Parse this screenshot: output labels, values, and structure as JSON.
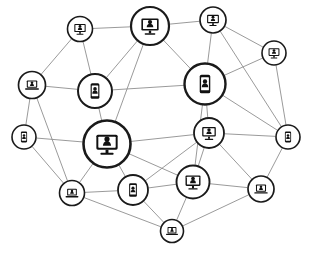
{
  "diagram": {
    "type": "node-link-network",
    "background_color": "#ffffff",
    "node_fill_color": "#ffffff",
    "node_stroke_color": "#1a1a1a",
    "icon_color": "#111111",
    "edge_color": "#8e8e8e",
    "node_count": 18,
    "edge_count": 38,
    "nodes": [
      {
        "id": "n1",
        "name": "monitor-node-top-left",
        "device": "monitor",
        "x": 80,
        "y": 29,
        "r": 12.5,
        "ring": 1.6
      },
      {
        "id": "n2",
        "name": "monitor-node-top-center",
        "device": "monitor",
        "x": 150,
        "y": 26,
        "r": 19.0,
        "ring": 2.2
      },
      {
        "id": "n3",
        "name": "monitor-node-top-right",
        "device": "monitor",
        "x": 213,
        "y": 20,
        "r": 13.0,
        "ring": 1.7
      },
      {
        "id": "n4",
        "name": "monitor-node-upper-right-edge",
        "device": "monitor",
        "x": 274,
        "y": 53,
        "r": 12.0,
        "ring": 1.6
      },
      {
        "id": "n5",
        "name": "laptop-node-upper-left-edge",
        "device": "laptop",
        "x": 32,
        "y": 85,
        "r": 13.5,
        "ring": 1.7
      },
      {
        "id": "n6",
        "name": "phone-node-upper-left-center",
        "device": "phone",
        "x": 95,
        "y": 91,
        "r": 17.0,
        "ring": 2.0
      },
      {
        "id": "n7",
        "name": "phone-node-upper-center-right",
        "device": "phone",
        "x": 205,
        "y": 84,
        "r": 20.5,
        "ring": 2.4
      },
      {
        "id": "n8",
        "name": "phone-node-left-edge",
        "device": "phone",
        "x": 24,
        "y": 137,
        "r": 12.0,
        "ring": 1.6
      },
      {
        "id": "n9",
        "name": "monitor-node-center-hub",
        "device": "monitor",
        "x": 107,
        "y": 144,
        "r": 23.5,
        "ring": 2.6
      },
      {
        "id": "n10",
        "name": "monitor-node-center-right",
        "device": "monitor",
        "x": 209,
        "y": 133,
        "r": 15.0,
        "ring": 1.8
      },
      {
        "id": "n11",
        "name": "phone-node-right-edge",
        "device": "phone",
        "x": 288,
        "y": 137,
        "r": 12.0,
        "ring": 1.6
      },
      {
        "id": "n12",
        "name": "laptop-node-lower-left",
        "device": "laptop",
        "x": 72,
        "y": 193,
        "r": 12.5,
        "ring": 1.6
      },
      {
        "id": "n13",
        "name": "phone-node-lower-center-left",
        "device": "phone",
        "x": 133,
        "y": 190,
        "r": 15.0,
        "ring": 1.8
      },
      {
        "id": "n14",
        "name": "monitor-node-lower-center",
        "device": "monitor",
        "x": 193,
        "y": 182,
        "r": 16.5,
        "ring": 1.9
      },
      {
        "id": "n15",
        "name": "laptop-node-lower-right",
        "device": "laptop",
        "x": 261,
        "y": 189,
        "r": 13.0,
        "ring": 1.7
      },
      {
        "id": "n16",
        "name": "laptop-node-bottom",
        "device": "laptop",
        "x": 172,
        "y": 231,
        "r": 11.5,
        "ring": 1.6
      },
      {
        "id": "n17",
        "name": "monitor-node-upper-mid-left",
        "device": "monitor",
        "x": 150,
        "y": 26,
        "r": 0.0,
        "ring": 0.0
      },
      {
        "id": "n18",
        "name": "phone-node-mid-right-hidden",
        "device": "phone",
        "x": 288,
        "y": 137,
        "r": 0.0,
        "ring": 0.0
      }
    ],
    "edges": [
      {
        "from": "n1",
        "to": "n2"
      },
      {
        "from": "n1",
        "to": "n5"
      },
      {
        "from": "n1",
        "to": "n6"
      },
      {
        "from": "n2",
        "to": "n3"
      },
      {
        "from": "n2",
        "to": "n6"
      },
      {
        "from": "n2",
        "to": "n7"
      },
      {
        "from": "n3",
        "to": "n4"
      },
      {
        "from": "n3",
        "to": "n7"
      },
      {
        "from": "n4",
        "to": "n7"
      },
      {
        "from": "n4",
        "to": "n11"
      },
      {
        "from": "n5",
        "to": "n6"
      },
      {
        "from": "n5",
        "to": "n8"
      },
      {
        "from": "n6",
        "to": "n7"
      },
      {
        "from": "n6",
        "to": "n9"
      },
      {
        "from": "n7",
        "to": "n10"
      },
      {
        "from": "n7",
        "to": "n11"
      },
      {
        "from": "n8",
        "to": "n9"
      },
      {
        "from": "n8",
        "to": "n12"
      },
      {
        "from": "n9",
        "to": "n10"
      },
      {
        "from": "n9",
        "to": "n12"
      },
      {
        "from": "n9",
        "to": "n13"
      },
      {
        "from": "n9",
        "to": "n14"
      },
      {
        "from": "n10",
        "to": "n11"
      },
      {
        "from": "n10",
        "to": "n14"
      },
      {
        "from": "n10",
        "to": "n15"
      },
      {
        "from": "n11",
        "to": "n15"
      },
      {
        "from": "n12",
        "to": "n13"
      },
      {
        "from": "n12",
        "to": "n16"
      },
      {
        "from": "n13",
        "to": "n14"
      },
      {
        "from": "n13",
        "to": "n16"
      },
      {
        "from": "n14",
        "to": "n15"
      },
      {
        "from": "n14",
        "to": "n16"
      },
      {
        "from": "n15",
        "to": "n16"
      },
      {
        "from": "n2",
        "to": "n9"
      },
      {
        "from": "n7",
        "to": "n14"
      },
      {
        "from": "n10",
        "to": "n13"
      },
      {
        "from": "n5",
        "to": "n12"
      },
      {
        "from": "n3",
        "to": "n11"
      }
    ]
  }
}
